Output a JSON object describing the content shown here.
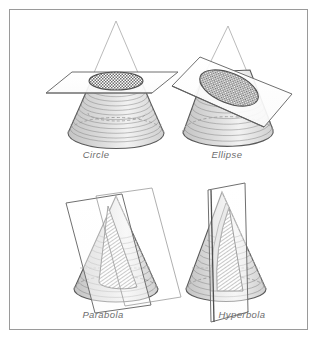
{
  "figure": {
    "border_color": "#9a9a9a",
    "background_color": "#ffffff",
    "label_color": "#6d6d6d",
    "cone_outline_color": "#5a5a5a",
    "hidden_line_color": "#9b9b9b",
    "plane_edge_color": "#6f6f6f",
    "cut_surface_color": "#8c8c8c",
    "cone_shade_color": "#cfcfcf",
    "panels": [
      {
        "id": "circle",
        "label": "Circle",
        "plane_orientation": "horizontal",
        "section_shape": "ellipse-foreshortened-circle",
        "label_x": 96,
        "label_y": 158
      },
      {
        "id": "ellipse",
        "label": "Ellipse",
        "plane_orientation": "oblique",
        "section_shape": "ellipse",
        "label_x": 227,
        "label_y": 158
      },
      {
        "id": "parabola",
        "label": "Parabola",
        "plane_orientation": "parallel-to-slant-side",
        "section_shape": "parabola",
        "label_x": 103,
        "label_y": 318
      },
      {
        "id": "hyperbola",
        "label": "Hyperbola",
        "plane_orientation": "vertical",
        "section_shape": "hyperbola",
        "label_x": 242,
        "label_y": 318
      }
    ]
  }
}
